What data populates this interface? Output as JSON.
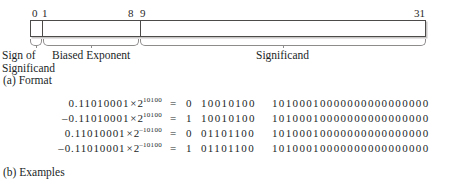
{
  "figure": {
    "format": {
      "bit_ruler": [
        "0",
        "1",
        "8",
        "9",
        "31"
      ],
      "field_labels": {
        "sign_line1": "Sign of",
        "sign_line2": "Significand",
        "exponent": "Biased Exponent",
        "significand": "Significand"
      },
      "caption": "(a) Format"
    },
    "examples": {
      "caption": "(b) Examples",
      "rows": [
        {
          "value": "0.11010001",
          "sign_prefix": "",
          "times": "×",
          "base": "2",
          "exponent": "10100",
          "equals": "=",
          "sign_bit": "0",
          "exponent_bits": "10010100",
          "significand_bits": "10100010000000000000000"
        },
        {
          "value": "0.11010001",
          "sign_prefix": "–",
          "times": "×",
          "base": "2",
          "exponent": "10100",
          "equals": "=",
          "sign_bit": "1",
          "exponent_bits": "10010100",
          "significand_bits": "10100010000000000000000"
        },
        {
          "value": "0.11010001",
          "sign_prefix": "",
          "times": "×",
          "base": "2",
          "exponent": "–10100",
          "equals": "=",
          "sign_bit": "0",
          "exponent_bits": "01101100",
          "significand_bits": "10100010000000000000000"
        },
        {
          "value": "0.11010001",
          "sign_prefix": "–",
          "times": "×",
          "base": "2",
          "exponent": "–10100",
          "equals": "=",
          "sign_bit": "1",
          "exponent_bits": "01101100",
          "significand_bits": "10100010000000000000000"
        }
      ]
    }
  }
}
